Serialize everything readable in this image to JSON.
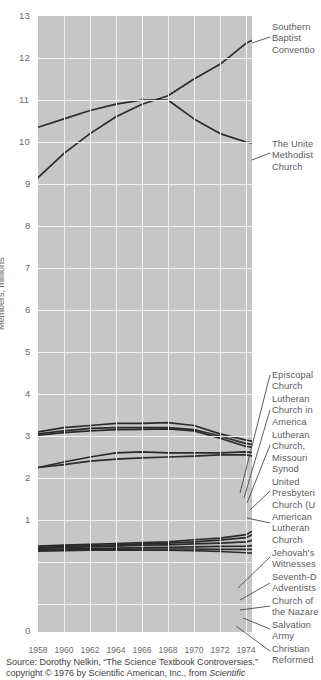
{
  "chart_data": {
    "type": "line",
    "title": "",
    "xlabel": "",
    "ylabel": "Members, millions",
    "xlim": [
      1958,
      1975
    ],
    "ylim": [
      0,
      13
    ],
    "grid": true,
    "legend_position": "right-callouts",
    "x_ticks": [
      "1958",
      "1960",
      "1962",
      "1964",
      "1966",
      "1968",
      "1970",
      "1972",
      "1974"
    ],
    "y_ticks": [
      "0",
      "1",
      "2",
      "3",
      "4",
      "5",
      "6",
      "7",
      "8",
      "9",
      "10",
      "11",
      "12",
      "13"
    ],
    "x": [
      1958,
      1960,
      1962,
      1964,
      1966,
      1968,
      1970,
      1972,
      1974,
      1975
    ],
    "series": [
      {
        "name": "Southern Baptist Convention",
        "values": [
          9.15,
          9.73,
          10.2,
          10.6,
          10.9,
          11.1,
          11.5,
          11.85,
          12.35,
          12.5
        ]
      },
      {
        "name": "The United Methodist Church",
        "values": [
          10.35,
          10.55,
          10.75,
          10.9,
          11.0,
          11.0,
          10.55,
          10.2,
          10.0,
          9.95
        ]
      },
      {
        "name": "Episcopal Church",
        "values": [
          3.1,
          3.2,
          3.25,
          3.3,
          3.3,
          3.32,
          3.25,
          3.05,
          2.9,
          2.85
        ]
      },
      {
        "name": "Lutheran Church in America",
        "values": [
          3.05,
          3.12,
          3.18,
          3.2,
          3.2,
          3.2,
          3.15,
          3.0,
          2.82,
          2.78
        ]
      },
      {
        "name": "Lutheran Church, Missouri Synod",
        "values": [
          3.02,
          3.08,
          3.12,
          3.15,
          3.16,
          3.17,
          3.12,
          2.95,
          2.75,
          2.72
        ]
      },
      {
        "name": "United Presbyterian Church (U.S.A.)",
        "values": [
          2.25,
          2.38,
          2.5,
          2.6,
          2.62,
          2.6,
          2.6,
          2.6,
          2.62,
          2.6
        ]
      },
      {
        "name": "American Lutheran Church",
        "values": [
          2.25,
          2.32,
          2.4,
          2.45,
          2.48,
          2.5,
          2.52,
          2.55,
          2.55,
          2.5
        ]
      },
      {
        "name": "Jehovah's Witnesses",
        "values": [
          0.38,
          0.4,
          0.42,
          0.44,
          0.46,
          0.48,
          0.53,
          0.57,
          0.65,
          0.82
        ]
      },
      {
        "name": "Seventh-Day Adventists",
        "values": [
          0.35,
          0.37,
          0.39,
          0.41,
          0.43,
          0.45,
          0.48,
          0.52,
          0.58,
          0.72
        ]
      },
      {
        "name": "Church of the Nazarene",
        "values": [
          0.33,
          0.34,
          0.36,
          0.38,
          0.4,
          0.41,
          0.43,
          0.45,
          0.48,
          0.55
        ]
      },
      {
        "name": "Salvation Army",
        "values": [
          0.3,
          0.31,
          0.32,
          0.33,
          0.34,
          0.35,
          0.36,
          0.37,
          0.38,
          0.4
        ]
      },
      {
        "name": "Christian Reformed",
        "values": [
          0.28,
          0.29,
          0.3,
          0.3,
          0.31,
          0.31,
          0.31,
          0.3,
          0.3,
          0.3
        ]
      },
      {
        "name": "Lower band",
        "values": [
          0.26,
          0.27,
          0.28,
          0.28,
          0.28,
          0.28,
          0.27,
          0.25,
          0.22,
          0.2
        ]
      }
    ],
    "callouts": [
      {
        "id": "southern-baptist-convention",
        "lines": [
          "Southern",
          "Baptist",
          "Conventio"
        ]
      },
      {
        "id": "united-methodist-church",
        "lines": [
          "The Unite",
          "Methodist",
          "Church"
        ]
      },
      {
        "id": "episcopal-church",
        "lines": [
          "Episcopal",
          "Church"
        ]
      },
      {
        "id": "lutheran-church-in-america",
        "lines": [
          "Lutheran",
          "Church in",
          "America"
        ]
      },
      {
        "id": "lutheran-church-missouri-synod",
        "lines": [
          "Lutheran",
          "Church,",
          "Missouri",
          "Synod"
        ]
      },
      {
        "id": "united-presbyterian-church",
        "lines": [
          "United",
          "Presbyteri",
          "Church (U"
        ]
      },
      {
        "id": "american-lutheran-church",
        "lines": [
          "American",
          "Lutheran",
          "Church"
        ]
      },
      {
        "id": "jehovahs-witnesses",
        "lines": [
          "Jehovah's",
          "Witnesses"
        ]
      },
      {
        "id": "seventh-day-adventists",
        "lines": [
          "Seventh-D",
          "Adventists"
        ]
      },
      {
        "id": "church-of-the-nazarene",
        "lines": [
          "Church of",
          "the Nazare"
        ]
      },
      {
        "id": "salvation-army",
        "lines": [
          "Salvation",
          "Army"
        ]
      },
      {
        "id": "christian-reformed",
        "lines": [
          "Christian",
          "Reformed"
        ]
      }
    ]
  },
  "axis": {
    "y_title": "Members, millions",
    "y_ticks": [
      "13",
      "12",
      "11",
      "10",
      "9",
      "8",
      "7",
      "6",
      "5",
      "4",
      "3",
      "2",
      "1",
      "0"
    ],
    "x_ticks": [
      "1958",
      "1960",
      "1962",
      "1964",
      "1966",
      "1968",
      "1970",
      "1972",
      "1974"
    ]
  },
  "callout_labels": {
    "southern_baptist": {
      "l1": "Southern",
      "l2": "Baptist",
      "l3": "Conventio"
    },
    "united_methodist": {
      "l1": "The Unite",
      "l2": "Methodist",
      "l3": "Church"
    },
    "episcopal": {
      "l1": "Episcopal",
      "l2": "Church"
    },
    "lutheran_america": {
      "l1": "Lutheran",
      "l2": "Church in",
      "l3": "America"
    },
    "lutheran_missouri": {
      "l1": "Lutheran",
      "l2": "Church,",
      "l3": "Missouri",
      "l4": "Synod"
    },
    "united_presbyterian": {
      "l1": "United",
      "l2": "Presbyteri",
      "l3": "Church (U"
    },
    "american_lutheran": {
      "l1": "American",
      "l2": "Lutheran",
      "l3": "Church"
    },
    "jehovahs_witnesses": {
      "l1": "Jehovah's",
      "l2": "Witnesses"
    },
    "seventh_day": {
      "l1": "Seventh-D",
      "l2": "Adventists"
    },
    "nazarene": {
      "l1": "Church of",
      "l2": "the Nazare"
    },
    "salvation_army": {
      "l1": "Salvation",
      "l2": "Army"
    },
    "christian_reformed": {
      "l1": "Christian",
      "l2": "Reformed"
    }
  },
  "source": {
    "line1": "Source: Dorothy Nelkin, “The Science Textbook Controversies,”",
    "line2_a": "copyright © 1976 by Scientific American, Inc., from ",
    "line2_b": "Scientific"
  },
  "colors": {
    "plot_background": "#c6c6c6",
    "gridline": "#f2f2f2",
    "line": "#2b2b2b",
    "tick_text": "#6b6b6b",
    "label_text": "#5b5b5b",
    "source_text": "#3f3f3f",
    "page_background": "#ffffff"
  }
}
